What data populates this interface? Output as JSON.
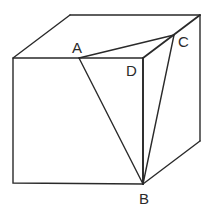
{
  "figure": {
    "type": "cube-diagram",
    "labels": {
      "A": "A",
      "B": "B",
      "C": "C",
      "D": "D"
    },
    "colors": {
      "stroke": "#2a2a2a",
      "background": "#ffffff"
    }
  }
}
